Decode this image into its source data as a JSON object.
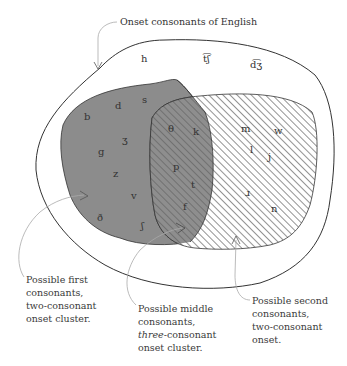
{
  "title_label": "Onset consonants of English",
  "outer_only": [
    "h",
    "t͡ʃ",
    "d͡ʒ"
  ],
  "first_only": [
    "b",
    "d",
    "s",
    "ʒ",
    "g",
    "z",
    "v",
    "ð",
    "ʃ"
  ],
  "overlap": [
    "θ",
    "k",
    "p",
    "t",
    "f"
  ],
  "second_only": [
    "m",
    "w",
    "l",
    "j",
    "ɹ",
    "n"
  ],
  "notes": {
    "first": [
      "Possible first",
      "consonants,",
      "two-consonant",
      "onset cluster."
    ],
    "middle": [
      "Possible middle",
      "consonants,",
      "three",
      "-consonant",
      "onset cluster."
    ],
    "second": [
      "Possible second",
      "consonants,",
      "two-consonant",
      "onset."
    ]
  },
  "colors": {
    "first_fill": "#8c8c8c",
    "hatch": "#777777",
    "outline": "#333333",
    "leader": "#aaaaaa"
  }
}
